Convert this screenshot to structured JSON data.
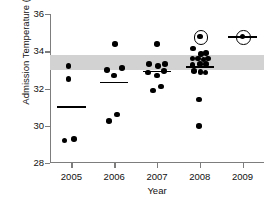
{
  "chart_data": {
    "type": "scatter",
    "title": "",
    "xlabel": "Year",
    "ylabel": "Admission Temperature (°C)",
    "xlim": [
      2004.5,
      2009.5
    ],
    "ylim": [
      28,
      36
    ],
    "ytick_values": [
      28,
      30,
      32,
      34,
      36
    ],
    "ytick_labels": [
      "28",
      "30",
      "32",
      "34",
      "36"
    ],
    "xtick_values": [
      2005,
      2006,
      2007,
      2008,
      2009
    ],
    "xtick_labels": [
      "2005",
      "2006",
      "2007",
      "2008",
      "2009"
    ],
    "grid": false,
    "legend": null,
    "reference_band": {
      "label": "normothermia reference range",
      "ymin": 33.0,
      "ymax": 33.8,
      "color": "#d2d2d2"
    },
    "marker_color": "#000000",
    "categories": [
      "2005",
      "2006",
      "2007",
      "2008",
      "2009"
    ],
    "series": [
      {
        "name": "Admission temperature",
        "points": [
          {
            "year": 2005,
            "jitter": -0.07,
            "value": 33.2,
            "circled": false
          },
          {
            "year": 2005,
            "jitter": -0.07,
            "value": 32.5,
            "circled": false
          },
          {
            "year": 2005,
            "jitter": -0.16,
            "value": 29.2,
            "circled": false
          },
          {
            "year": 2005,
            "jitter": 0.06,
            "value": 29.3,
            "circled": false
          },
          {
            "year": 2006,
            "jitter": 0.02,
            "value": 34.4,
            "circled": false
          },
          {
            "year": 2006,
            "jitter": -0.17,
            "value": 33.0,
            "circled": false
          },
          {
            "year": 2006,
            "jitter": 0.18,
            "value": 33.1,
            "circled": false
          },
          {
            "year": 2006,
            "jitter": 0.0,
            "value": 32.7,
            "circled": false
          },
          {
            "year": 2006,
            "jitter": -0.12,
            "value": 30.25,
            "circled": false
          },
          {
            "year": 2006,
            "jitter": 0.07,
            "value": 30.6,
            "circled": false
          },
          {
            "year": 2007,
            "jitter": 0.0,
            "value": 34.4,
            "circled": false
          },
          {
            "year": 2007,
            "jitter": -0.18,
            "value": 33.3,
            "circled": false
          },
          {
            "year": 2007,
            "jitter": 0.02,
            "value": 33.2,
            "circled": false
          },
          {
            "year": 2007,
            "jitter": 0.18,
            "value": 33.3,
            "circled": false
          },
          {
            "year": 2007,
            "jitter": -0.21,
            "value": 32.85,
            "circled": false
          },
          {
            "year": 2007,
            "jitter": 0.0,
            "value": 32.7,
            "circled": false
          },
          {
            "year": 2007,
            "jitter": 0.17,
            "value": 32.95,
            "circled": false
          },
          {
            "year": 2007,
            "jitter": -0.1,
            "value": 31.9,
            "circled": false
          },
          {
            "year": 2007,
            "jitter": 0.09,
            "value": 32.1,
            "circled": false
          },
          {
            "year": 2008,
            "jitter": -0.16,
            "value": 34.15,
            "circled": false
          },
          {
            "year": 2008,
            "jitter": 0.03,
            "value": 33.85,
            "circled": false
          },
          {
            "year": 2008,
            "jitter": 0.15,
            "value": 33.9,
            "circled": false
          },
          {
            "year": 2008,
            "jitter": -0.17,
            "value": 33.6,
            "circled": false
          },
          {
            "year": 2008,
            "jitter": -0.04,
            "value": 33.6,
            "circled": false
          },
          {
            "year": 2008,
            "jitter": 0.09,
            "value": 33.55,
            "circled": false
          },
          {
            "year": 2008,
            "jitter": 0.19,
            "value": 33.6,
            "circled": false
          },
          {
            "year": 2008,
            "jitter": -0.17,
            "value": 33.25,
            "circled": false
          },
          {
            "year": 2008,
            "jitter": 0.01,
            "value": 33.3,
            "circled": false
          },
          {
            "year": 2008,
            "jitter": 0.14,
            "value": 33.3,
            "circled": false
          },
          {
            "year": 2008,
            "jitter": -0.13,
            "value": 32.95,
            "circled": false
          },
          {
            "year": 2008,
            "jitter": 0.02,
            "value": 32.9,
            "circled": false
          },
          {
            "year": 2008,
            "jitter": 0.13,
            "value": 32.85,
            "circled": false
          },
          {
            "year": 2008,
            "jitter": -0.02,
            "value": 31.4,
            "circled": false
          },
          {
            "year": 2008,
            "jitter": -0.02,
            "value": 30.0,
            "circled": false
          },
          {
            "year": 2008,
            "jitter": 0.0,
            "value": 34.8,
            "circled": true
          },
          {
            "year": 2009,
            "jitter": 0.0,
            "value": 34.8,
            "circled": true
          }
        ],
        "mean_lines": [
          {
            "year": 2005,
            "value": 31.05,
            "half_width": 0.33
          },
          {
            "year": 2006,
            "value": 32.35,
            "half_width": 0.33
          },
          {
            "year": 2007,
            "value": 32.95,
            "half_width": 0.33
          },
          {
            "year": 2008,
            "value": 33.2,
            "half_width": 0.33
          },
          {
            "year": 2009,
            "value": 34.8,
            "half_width": 0.33
          }
        ]
      }
    ]
  }
}
